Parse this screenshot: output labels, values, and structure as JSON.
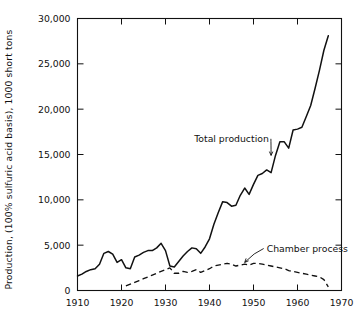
{
  "chart_data": {
    "type": "line",
    "title": "",
    "xlabel": "",
    "ylabel": "Production, (100% sulfuric acid basis), 1000 short tons",
    "xlim": [
      1910,
      1970
    ],
    "ylim": [
      0,
      30000
    ],
    "xticks": [
      1910,
      1920,
      1930,
      1940,
      1950,
      1960,
      1970
    ],
    "xtick_labels": [
      "1910",
      "1920",
      "1930",
      "1940",
      "1950",
      "1960",
      "1970"
    ],
    "yticks": [
      0,
      5000,
      10000,
      15000,
      20000,
      25000,
      30000
    ],
    "ytick_labels": [
      "0",
      "5,000",
      "10,000",
      "15,000",
      "20,000",
      "25,000",
      "30,000"
    ],
    "grid": false,
    "legend_position": "inline-annotations",
    "series": [
      {
        "name": "Total production",
        "style": "solid",
        "color": "#111111",
        "x": [
          1910,
          1911,
          1912,
          1913,
          1914,
          1915,
          1916,
          1917,
          1918,
          1919,
          1920,
          1921,
          1922,
          1923,
          1924,
          1925,
          1926,
          1927,
          1928,
          1929,
          1930,
          1931,
          1932,
          1933,
          1934,
          1935,
          1936,
          1937,
          1938,
          1939,
          1940,
          1941,
          1942,
          1943,
          1944,
          1945,
          1946,
          1947,
          1948,
          1949,
          1950,
          1951,
          1952,
          1953,
          1954,
          1955,
          1956,
          1957,
          1958,
          1959,
          1960,
          1961,
          1962,
          1963,
          1964,
          1965,
          1966,
          1967
        ],
        "values": [
          1600,
          1800,
          2100,
          2300,
          2400,
          2900,
          4100,
          4300,
          4000,
          3100,
          3400,
          2500,
          2400,
          3700,
          3900,
          4200,
          4400,
          4400,
          4700,
          5200,
          4400,
          2700,
          2600,
          3200,
          3800,
          4300,
          4700,
          4600,
          4100,
          4800,
          5700,
          7300,
          8600,
          9800,
          9700,
          9300,
          9400,
          10500,
          11300,
          10600,
          11700,
          12700,
          12900,
          13300,
          13000,
          14900,
          16400,
          16400,
          15700,
          17700,
          17800,
          18000,
          19200,
          20400,
          22300,
          24300,
          26500,
          28100
        ]
      },
      {
        "name": "Chamber process",
        "style": "dashed",
        "color": "#111111",
        "x": [
          1921,
          1922,
          1923,
          1924,
          1925,
          1926,
          1927,
          1928,
          1929,
          1930,
          1931,
          1932,
          1933,
          1934,
          1935,
          1936,
          1937,
          1938,
          1939,
          1940,
          1941,
          1942,
          1943,
          1944,
          1945,
          1946,
          1947,
          1948,
          1949,
          1950,
          1951,
          1952,
          1953,
          1954,
          1955,
          1956,
          1957,
          1958,
          1959,
          1960,
          1961,
          1962,
          1963,
          1964,
          1965,
          1966,
          1967
        ],
        "values": [
          500,
          700,
          900,
          1100,
          1300,
          1500,
          1700,
          1900,
          2100,
          2300,
          2500,
          1900,
          1900,
          2100,
          2000,
          2100,
          2300,
          2000,
          2200,
          2400,
          2700,
          2800,
          2900,
          3000,
          2900,
          2700,
          2800,
          2900,
          2800,
          3000,
          3000,
          2900,
          2800,
          2700,
          2600,
          2500,
          2400,
          2200,
          2100,
          2000,
          1900,
          1800,
          1700,
          1600,
          1500,
          1200,
          400
        ]
      }
    ],
    "annotations": [
      {
        "text": "Total production",
        "x": 1945,
        "y": 16400,
        "points_to_x": 1954,
        "points_to_y": 14900
      },
      {
        "text": "Chamber process",
        "x": 1953,
        "y": 4300,
        "points_to_x": 1948,
        "points_to_y": 3100
      }
    ]
  }
}
